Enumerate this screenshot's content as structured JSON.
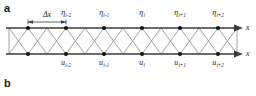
{
  "figure": {
    "panels": [
      {
        "id": "a",
        "letter": "a"
      },
      {
        "id": "b",
        "letter": "b"
      }
    ]
  },
  "diagram": {
    "spacing_indicator": {
      "label": "Δx",
      "from_node": 0,
      "to_node": 1
    },
    "top_axis": {
      "label": "x",
      "arrow": true
    },
    "bottom_axis": {
      "label": "x",
      "arrow": true
    },
    "node_count": 6,
    "node_x": [
      28,
      66,
      104,
      142,
      180,
      218
    ],
    "top_axis_y": 28,
    "bottom_axis_y": 54,
    "top_nodes": [
      {
        "symbol": "η",
        "subscript": "i-2"
      },
      {
        "symbol": "η",
        "subscript": "i-1"
      },
      {
        "symbol": "η",
        "subscript": "i"
      },
      {
        "symbol": "η",
        "subscript": "i+1"
      },
      {
        "symbol": "η",
        "subscript": "i+2"
      }
    ],
    "bottom_nodes": [
      {
        "symbol": "u",
        "subscript": "i-2"
      },
      {
        "symbol": "u",
        "subscript": "i-1"
      },
      {
        "symbol": "u",
        "subscript": "i"
      },
      {
        "symbol": "u",
        "subscript": "i+1"
      },
      {
        "symbol": "u",
        "subscript": "i+2"
      }
    ],
    "colors": {
      "axis": "#3a3a3a",
      "mesh": "#8a8a8a",
      "node": "#111111",
      "text": "#1c1c1c",
      "background": "#ffffff"
    }
  }
}
